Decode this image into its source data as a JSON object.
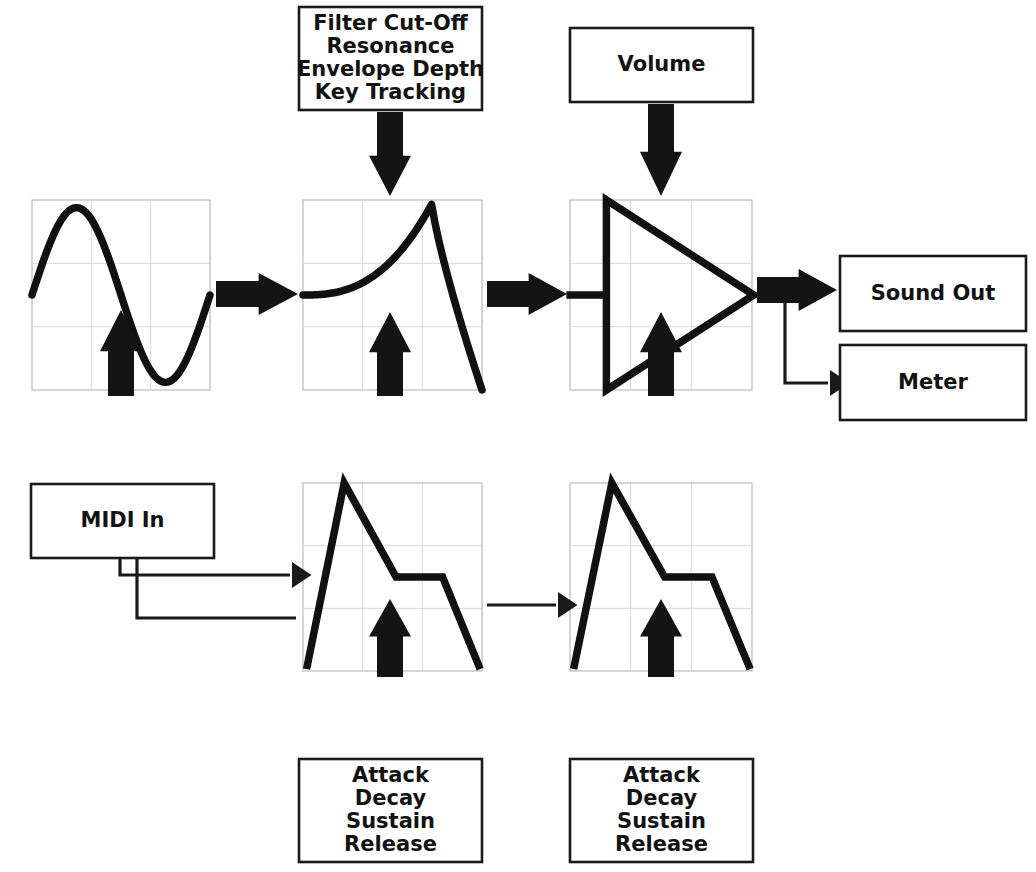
{
  "diagram": {
    "canvas": {
      "width": 1036,
      "height": 872
    },
    "colors": {
      "background": "#ffffff",
      "ink": "#141414",
      "panel_border": "#b9b9b9",
      "panel_grid": "#d8d8d8",
      "box_border": "#1a1a1a"
    }
  },
  "boxes": {
    "filter_params": {
      "label": "Filter Cut-Off\nResonance\nEnvelope Depth\nKey Tracking",
      "lines": [
        "Filter Cut-Off",
        "Resonance",
        "Envelope Depth",
        "Key Tracking"
      ],
      "x": 299,
      "y": 7,
      "w": 183,
      "h": 103
    },
    "volume": {
      "label": "Volume",
      "lines": [
        "Volume"
      ],
      "x": 570,
      "y": 28,
      "w": 183,
      "h": 74
    },
    "sound_out": {
      "label": "Sound Out",
      "lines": [
        "Sound Out"
      ],
      "x": 840,
      "y": 256,
      "w": 186,
      "h": 75
    },
    "meter": {
      "label": "Meter",
      "lines": [
        "Meter"
      ],
      "x": 840,
      "y": 345,
      "w": 186,
      "h": 75
    },
    "midi_in": {
      "label": "MIDI In",
      "lines": [
        "MIDI In"
      ],
      "x": 31,
      "y": 484,
      "w": 183,
      "h": 74
    },
    "env1_params": {
      "label": "Attack\nDecay\nSustain\nRelease",
      "lines": [
        "Attack",
        "Decay",
        "Sustain",
        "Release"
      ],
      "x": 299,
      "y": 759,
      "w": 183,
      "h": 103
    },
    "env2_params": {
      "label": "Attack\nDecay\nSustain\nRelease",
      "lines": [
        "Attack",
        "Decay",
        "Sustain",
        "Release"
      ],
      "x": 570,
      "y": 759,
      "w": 183,
      "h": 103
    }
  },
  "panels": {
    "oscillator": {
      "name": "oscillator-waveform",
      "waveform": "sine",
      "x": 32,
      "y": 200,
      "w": 178,
      "h": 190,
      "grid_cols": 3,
      "grid_rows": 3
    },
    "filter": {
      "name": "filter-response",
      "waveform": "resonant-lowpass",
      "x": 303,
      "y": 200,
      "w": 179,
      "h": 190,
      "grid_cols": 3,
      "grid_rows": 3
    },
    "amplifier": {
      "name": "amplifier-symbol",
      "waveform": "amplifier-triangle",
      "x": 570,
      "y": 200,
      "w": 182,
      "h": 190,
      "grid_cols": 3,
      "grid_rows": 3
    },
    "envelope1": {
      "name": "filter-envelope",
      "waveform": "adsr",
      "x": 303,
      "y": 483,
      "w": 179,
      "h": 188,
      "grid_cols": 3,
      "grid_rows": 3
    },
    "envelope2": {
      "name": "amplitude-envelope",
      "waveform": "adsr",
      "x": 570,
      "y": 483,
      "w": 182,
      "h": 188,
      "grid_cols": 3,
      "grid_rows": 3
    }
  },
  "signal_path": {
    "block_arrows": [
      {
        "name": "arrow-osc-to-filter",
        "dir": "right",
        "x": 216,
        "y": 294,
        "len": 82,
        "shaft": 26,
        "head": 42
      },
      {
        "name": "arrow-filter-to-amp",
        "dir": "right",
        "x": 487,
        "y": 294,
        "len": 80,
        "shaft": 26,
        "head": 42
      },
      {
        "name": "arrow-amp-to-soundout",
        "dir": "right",
        "x": 757,
        "y": 290,
        "len": 80,
        "shaft": 26,
        "head": 42
      },
      {
        "name": "arrow-filterparams-to-filter",
        "dir": "down",
        "x": 390,
        "y": 112,
        "len": 84,
        "shaft": 26,
        "head": 42
      },
      {
        "name": "arrow-volume-to-amp",
        "dir": "down",
        "x": 661,
        "y": 104,
        "len": 92,
        "shaft": 26,
        "head": 42
      },
      {
        "name": "arrow-midi-to-osc",
        "dir": "up",
        "x": 121,
        "y": 396,
        "len": 86,
        "shaft": 26,
        "head": 42
      },
      {
        "name": "arrow-env1-to-filter",
        "dir": "up",
        "x": 390,
        "y": 396,
        "len": 84,
        "shaft": 26,
        "head": 42
      },
      {
        "name": "arrow-env2-to-amp",
        "dir": "up",
        "x": 661,
        "y": 396,
        "len": 84,
        "shaft": 26,
        "head": 42
      },
      {
        "name": "arrow-env1params-to-env1",
        "dir": "up",
        "x": 390,
        "y": 677,
        "len": 78,
        "shaft": 26,
        "head": 42
      },
      {
        "name": "arrow-env2params-to-env2",
        "dir": "up",
        "x": 661,
        "y": 677,
        "len": 78,
        "shaft": 26,
        "head": 42
      }
    ],
    "thin_connections": [
      {
        "name": "midi-to-env1-line",
        "points": "120,559 120,575 290,575",
        "arrow": {
          "x": 292,
          "y": 575,
          "dir": "right"
        }
      },
      {
        "name": "midi-to-env2-line",
        "points": "137,559 137,618 296,618",
        "arrow": null
      },
      {
        "name": "env1-to-env2-line",
        "points": "487,605 556,605",
        "arrow": {
          "x": 558,
          "y": 605,
          "dir": "right"
        }
      },
      {
        "name": "amp-to-meter-line",
        "points": "785,303 785,383 828,383",
        "arrow": {
          "x": 830,
          "y": 383,
          "dir": "right"
        }
      }
    ]
  }
}
